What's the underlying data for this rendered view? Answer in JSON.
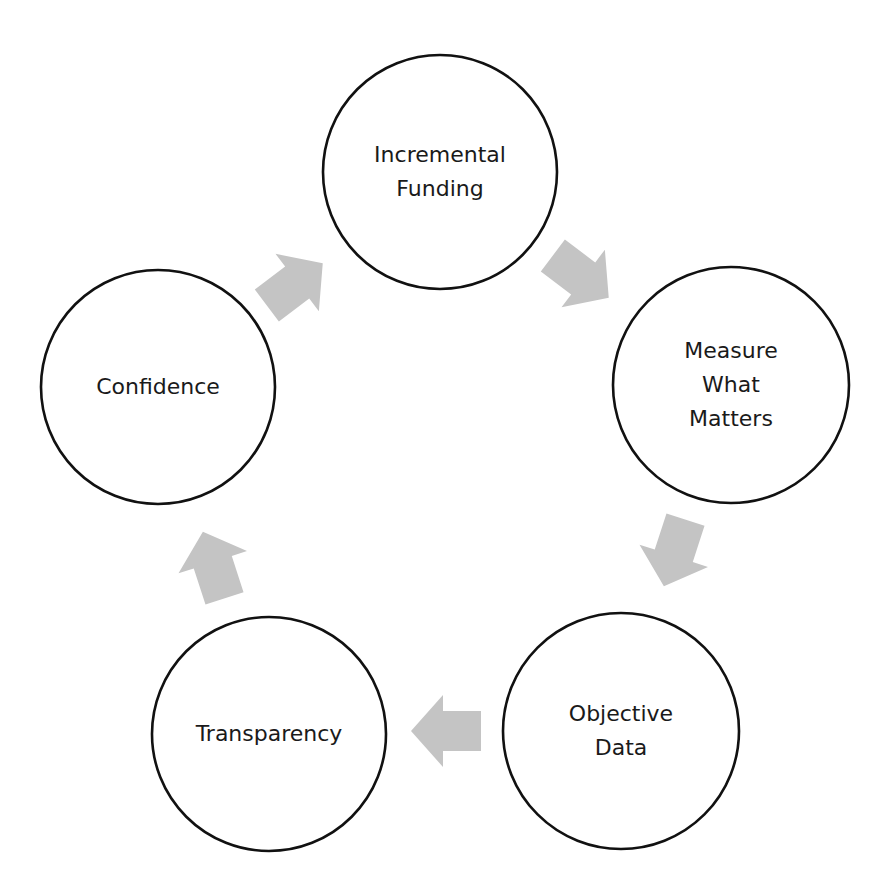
{
  "diagram": {
    "type": "cycle",
    "colors": {
      "background": "#ffffff",
      "circle_stroke": "#111111",
      "arrow_fill": "#c4c4c4",
      "text": "#1a1a1a"
    },
    "nodes": [
      {
        "id": "incremental-funding",
        "lines": [
          "Incremental",
          "Funding"
        ],
        "cx": 440,
        "cy": 172,
        "r": 117
      },
      {
        "id": "measure-what-matters",
        "lines": [
          "Measure",
          "What",
          "Matters"
        ],
        "cx": 731,
        "cy": 385,
        "r": 118
      },
      {
        "id": "objective-data",
        "lines": [
          "Objective",
          "Data"
        ],
        "cx": 621,
        "cy": 731,
        "r": 118
      },
      {
        "id": "transparency",
        "lines": [
          "Transparency"
        ],
        "cx": 269,
        "cy": 734,
        "r": 117
      },
      {
        "id": "confidence",
        "lines": [
          "Confidence"
        ],
        "cx": 158,
        "cy": 387,
        "r": 117
      }
    ],
    "arrows": [
      {
        "from": "incremental-funding",
        "to": "measure-what-matters",
        "cx": 580,
        "cy": 276,
        "angle": 37
      },
      {
        "from": "measure-what-matters",
        "to": "objective-data",
        "cx": 675,
        "cy": 552,
        "angle": 108
      },
      {
        "from": "objective-data",
        "to": "transparency",
        "cx": 447,
        "cy": 731,
        "angle": 180
      },
      {
        "from": "transparency",
        "to": "confidence",
        "cx": 214,
        "cy": 566,
        "angle": -108
      },
      {
        "from": "confidence",
        "to": "incremental-funding",
        "cx": 294,
        "cy": 285,
        "angle": -37
      }
    ]
  }
}
